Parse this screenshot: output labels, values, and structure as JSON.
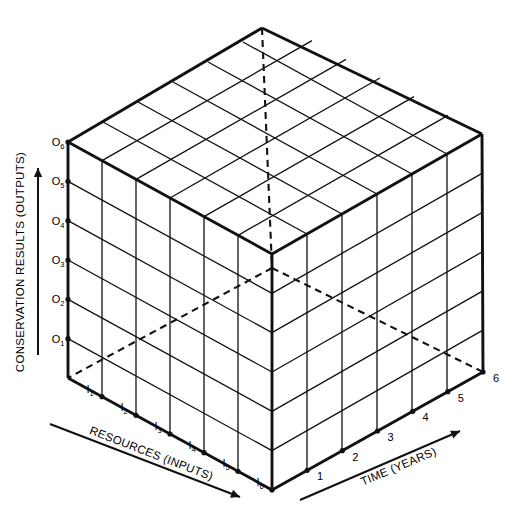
{
  "figure": {
    "title": "",
    "type": "isometric-cube-diagram",
    "background_color": "#ffffff",
    "line_color": "#111111"
  },
  "axes": {
    "vertical": {
      "name": "conservation-results-axis",
      "title": "CONSERVATION RESULTS (OUTPUTS)",
      "arrow": "up-arrow-icon",
      "tick_prefix": "O",
      "ticks": [
        "O1",
        "O2",
        "O3",
        "O4",
        "O5",
        "O6"
      ],
      "tick_bases": [
        "O",
        "O",
        "O",
        "O",
        "O",
        "O"
      ],
      "tick_subscripts": [
        "1",
        "2",
        "3",
        "4",
        "5",
        "6"
      ]
    },
    "left": {
      "name": "resources-axis",
      "title": "RESOURCES (INPUTS)",
      "arrow": "down-right-arrow-icon",
      "tick_prefix": "I",
      "ticks": [
        "I1",
        "I2",
        "I3",
        "I4",
        "I5",
        "I6"
      ],
      "tick_bases": [
        "I",
        "I",
        "I",
        "I",
        "I",
        "I"
      ],
      "tick_subscripts": [
        "1",
        "2",
        "3",
        "4",
        "5",
        "6"
      ]
    },
    "right": {
      "name": "time-axis",
      "title": "TIME (YEARS)",
      "arrow": "up-right-arrow-icon",
      "ticks": [
        "1",
        "2",
        "3",
        "4",
        "5",
        "6"
      ]
    }
  },
  "chart_data": {
    "type": "diagram",
    "title": "",
    "grid": true,
    "divisions": 6,
    "faces": [
      {
        "name": "top-face",
        "rows": 6,
        "cols": 6
      },
      {
        "name": "left-face",
        "rows": 6,
        "cols": 6
      },
      {
        "name": "right-face",
        "rows": 6,
        "cols": 6
      }
    ],
    "hidden_edges": [
      "apex-to-hidden-vertex",
      "hidden-vertex-to-left-bottom",
      "hidden-vertex-to-right-bottom"
    ],
    "xlabel": "TIME (YEARS)",
    "ylabel": "CONSERVATION RESULTS (OUTPUTS)",
    "zlabel": "RESOURCES (INPUTS)",
    "xticks": [
      "1",
      "2",
      "3",
      "4",
      "5",
      "6"
    ],
    "yticks": [
      "O1",
      "O2",
      "O3",
      "O4",
      "O5",
      "O6"
    ],
    "zticks": [
      "I1",
      "I2",
      "I3",
      "I4",
      "I5",
      "I6"
    ]
  }
}
